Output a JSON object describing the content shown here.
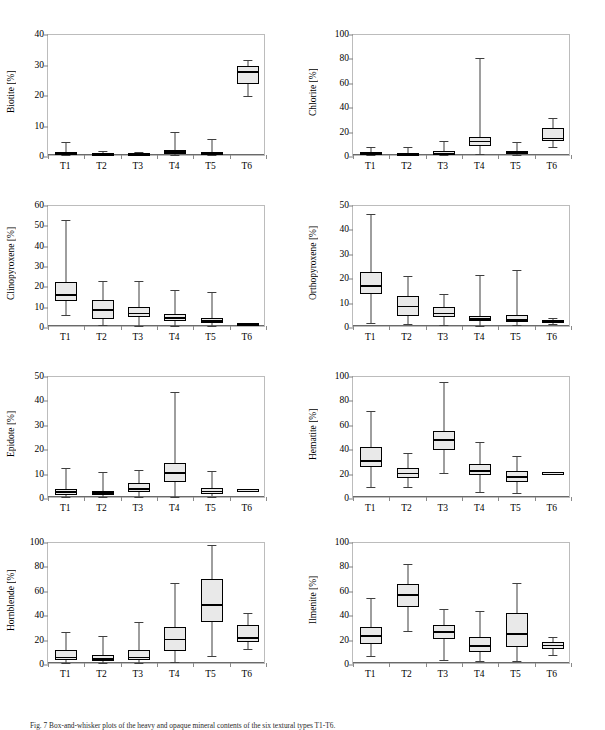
{
  "figure": {
    "caption": "Fig. 7   Box-and-whisker plots of the heavy and opaque mineral contents of the six textural types T1-T6.",
    "categories": [
      "T1",
      "T2",
      "T3",
      "T4",
      "T5",
      "T6"
    ],
    "axis_unit": "[%]",
    "box_fill_color": "#e9e9e9",
    "box_edge_color": "#000000",
    "frame_color": "#bcbcbc"
  },
  "chart_data": [
    {
      "type": "box",
      "title": "Biotite",
      "ylabel": "Biotite [%]",
      "xlabel": "",
      "categories": [
        "T1",
        "T2",
        "T3",
        "T4",
        "T5",
        "T6"
      ],
      "ylim": [
        0,
        40
      ],
      "yticks": [
        0,
        10,
        20,
        30,
        40
      ],
      "grid": false,
      "boxes": [
        {
          "category": "T1",
          "whisker_low": 0.0,
          "q1": 0.1,
          "median": 0.4,
          "q3": 0.9,
          "whisker_high": 4.2
        },
        {
          "category": "T2",
          "whisker_low": 0.0,
          "q1": 0.1,
          "median": 0.3,
          "q3": 0.6,
          "whisker_high": 1.4
        },
        {
          "category": "T3",
          "whisker_low": 0.0,
          "q1": 0.1,
          "median": 0.2,
          "q3": 0.5,
          "whisker_high": 1.1
        },
        {
          "category": "T4",
          "whisker_low": 0.0,
          "q1": 0.3,
          "median": 0.9,
          "q3": 1.7,
          "whisker_high": 7.6
        },
        {
          "category": "T5",
          "whisker_low": 0.0,
          "q1": 0.1,
          "median": 0.4,
          "q3": 1.0,
          "whisker_high": 5.4
        },
        {
          "category": "T6",
          "whisker_low": 19.2,
          "q1": 23.2,
          "median": 27.1,
          "q3": 29.2,
          "whisker_high": 31.1
        }
      ]
    },
    {
      "type": "box",
      "title": "Chlorite",
      "ylabel": "Chlorite [%]",
      "xlabel": "",
      "categories": [
        "T1",
        "T2",
        "T3",
        "T4",
        "T5",
        "T6"
      ],
      "ylim": [
        0,
        100
      ],
      "yticks": [
        0,
        20,
        40,
        60,
        80,
        100
      ],
      "grid": false,
      "boxes": [
        {
          "category": "T1",
          "whisker_low": 0.0,
          "q1": 0.3,
          "median": 1.2,
          "q3": 2.6,
          "whisker_high": 6.6
        },
        {
          "category": "T2",
          "whisker_low": 0.0,
          "q1": 0.2,
          "median": 0.6,
          "q3": 1.5,
          "whisker_high": 6.5
        },
        {
          "category": "T3",
          "whisker_low": 0.0,
          "q1": 0.4,
          "median": 1.3,
          "q3": 3.2,
          "whisker_high": 11.5
        },
        {
          "category": "T4",
          "whisker_low": 0.5,
          "q1": 7.6,
          "median": 11.1,
          "q3": 15.1,
          "whisker_high": 79.6
        },
        {
          "category": "T5",
          "whisker_low": 0.0,
          "q1": 0.6,
          "median": 1.6,
          "q3": 3.3,
          "whisker_high": 10.8
        },
        {
          "category": "T6",
          "whisker_low": 6.2,
          "q1": 11.2,
          "median": 13.5,
          "q3": 22.5,
          "whisker_high": 30.6
        }
      ]
    },
    {
      "type": "box",
      "title": "Clinopyroxene",
      "ylabel": "Clinopyroxene [%]",
      "xlabel": "",
      "categories": [
        "T1",
        "T2",
        "T3",
        "T4",
        "T5",
        "T6"
      ],
      "ylim": [
        0,
        60
      ],
      "yticks": [
        0,
        10,
        20,
        30,
        40,
        50,
        60
      ],
      "grid": false,
      "boxes": [
        {
          "category": "T1",
          "whisker_low": 5.6,
          "q1": 12.4,
          "median": 15.3,
          "q3": 21.5,
          "whisker_high": 52.2
        },
        {
          "category": "T2",
          "whisker_low": 0.3,
          "q1": 3.3,
          "median": 7.7,
          "q3": 12.7,
          "whisker_high": 22.1
        },
        {
          "category": "T3",
          "whisker_low": 0.2,
          "q1": 4.5,
          "median": 6.2,
          "q3": 9.2,
          "whisker_high": 22.3
        },
        {
          "category": "T4",
          "whisker_low": 0.2,
          "q1": 2.7,
          "median": 3.9,
          "q3": 6.1,
          "whisker_high": 17.5
        },
        {
          "category": "T5",
          "whisker_low": 0.2,
          "q1": 1.4,
          "median": 2.4,
          "q3": 4.0,
          "whisker_high": 16.6
        },
        {
          "category": "T6",
          "whisker_low": 0.7,
          "q1": 0.9,
          "median": 1.1,
          "q3": 1.3,
          "whisker_high": 1.6
        }
      ]
    },
    {
      "type": "box",
      "title": "Orthopyroxene",
      "ylabel": "Orthopyroxene [%]",
      "xlabel": "",
      "categories": [
        "T1",
        "T2",
        "T3",
        "T4",
        "T5",
        "T6"
      ],
      "ylim": [
        0,
        50
      ],
      "yticks": [
        0,
        10,
        20,
        30,
        40,
        50
      ],
      "grid": false,
      "boxes": [
        {
          "category": "T1",
          "whisker_low": 1.4,
          "q1": 13.1,
          "median": 16.3,
          "q3": 22.2,
          "whisker_high": 45.8
        },
        {
          "category": "T2",
          "whisker_low": 1.0,
          "q1": 4.2,
          "median": 8.0,
          "q3": 12.3,
          "whisker_high": 20.3
        },
        {
          "category": "T3",
          "whisker_low": 0.3,
          "q1": 3.5,
          "median": 5.1,
          "q3": 7.6,
          "whisker_high": 13.3
        },
        {
          "category": "T4",
          "whisker_low": 0.2,
          "q1": 1.9,
          "median": 2.8,
          "q3": 4.2,
          "whisker_high": 21.0
        },
        {
          "category": "T5",
          "whisker_low": 0.3,
          "q1": 1.6,
          "median": 2.5,
          "q3": 4.7,
          "whisker_high": 23.0
        },
        {
          "category": "T6",
          "whisker_low": 1.0,
          "q1": 1.4,
          "median": 1.8,
          "q3": 2.3,
          "whisker_high": 3.1
        }
      ]
    },
    {
      "type": "box",
      "title": "Epidote",
      "ylabel": "Epidote [%]",
      "xlabel": "",
      "categories": [
        "T1",
        "T2",
        "T3",
        "T4",
        "T5",
        "T6"
      ],
      "ylim": [
        0,
        50
      ],
      "yticks": [
        0,
        10,
        20,
        30,
        40,
        50
      ],
      "grid": false,
      "boxes": [
        {
          "category": "T1",
          "whisker_low": 0.1,
          "q1": 0.9,
          "median": 2.1,
          "q3": 3.1,
          "whisker_high": 11.9
        },
        {
          "category": "T2",
          "whisker_low": 0.0,
          "q1": 0.8,
          "median": 1.5,
          "q3": 2.4,
          "whisker_high": 10.2
        },
        {
          "category": "T3",
          "whisker_low": 0.2,
          "q1": 1.9,
          "median": 3.2,
          "q3": 5.6,
          "whisker_high": 10.9
        },
        {
          "category": "T4",
          "whisker_low": 0.2,
          "q1": 6.0,
          "median": 9.7,
          "q3": 13.8,
          "whisker_high": 43.2
        },
        {
          "category": "T5",
          "whisker_low": 0.2,
          "q1": 1.3,
          "median": 2.3,
          "q3": 3.5,
          "whisker_high": 10.6
        },
        {
          "category": "T6",
          "whisker_low": 2.9,
          "q1": 3.0,
          "median": 3.1,
          "q3": 3.2,
          "whisker_high": 3.3
        }
      ]
    },
    {
      "type": "box",
      "title": "Hematite",
      "ylabel": "Hematite [%]",
      "xlabel": "",
      "categories": [
        "T1",
        "T2",
        "T3",
        "T4",
        "T5",
        "T6"
      ],
      "ylim": [
        0,
        100
      ],
      "yticks": [
        0,
        20,
        40,
        60,
        80,
        100
      ],
      "grid": false,
      "boxes": [
        {
          "category": "T1",
          "whisker_low": 8.3,
          "q1": 24.8,
          "median": 29.5,
          "q3": 41.0,
          "whisker_high": 70.8
        },
        {
          "category": "T2",
          "whisker_low": 7.9,
          "q1": 15.2,
          "median": 19.3,
          "q3": 23.4,
          "whisker_high": 36.0
        },
        {
          "category": "T3",
          "whisker_low": 19.3,
          "q1": 38.8,
          "median": 46.7,
          "q3": 54.5,
          "whisker_high": 94.0
        },
        {
          "category": "T4",
          "whisker_low": 4.4,
          "q1": 18.2,
          "median": 21.5,
          "q3": 26.8,
          "whisker_high": 45.2
        },
        {
          "category": "T5",
          "whisker_low": 3.5,
          "q1": 12.6,
          "median": 16.3,
          "q3": 21.6,
          "whisker_high": 33.3
        },
        {
          "category": "T6",
          "whisker_low": 19.7,
          "q1": 19.9,
          "median": 20.1,
          "q3": 20.3,
          "whisker_high": 20.5
        }
      ]
    },
    {
      "type": "box",
      "title": "Hornblende",
      "ylabel": "Hornblende [%]",
      "xlabel": "",
      "categories": [
        "T1",
        "T2",
        "T3",
        "T4",
        "T5",
        "T6"
      ],
      "ylim": [
        0,
        100
      ],
      "yticks": [
        0,
        20,
        40,
        60,
        80,
        100
      ],
      "grid": false,
      "boxes": [
        {
          "category": "T1",
          "whisker_low": 0.2,
          "q1": 2.3,
          "median": 4.6,
          "q3": 10.3,
          "whisker_high": 25.3
        },
        {
          "category": "T2",
          "whisker_low": 0.2,
          "q1": 1.9,
          "median": 3.3,
          "q3": 6.5,
          "whisker_high": 22.1
        },
        {
          "category": "T3",
          "whisker_low": 0.2,
          "q1": 2.2,
          "median": 4.5,
          "q3": 10.4,
          "whisker_high": 33.5
        },
        {
          "category": "T4",
          "whisker_low": 0.5,
          "q1": 10.0,
          "median": 19.3,
          "q3": 29.8,
          "whisker_high": 65.9
        },
        {
          "category": "T5",
          "whisker_low": 5.7,
          "q1": 34.0,
          "median": 47.5,
          "q3": 68.5,
          "whisker_high": 97.0
        },
        {
          "category": "T6",
          "whisker_low": 11.1,
          "q1": 17.0,
          "median": 20.3,
          "q3": 31.2,
          "whisker_high": 41.2
        }
      ]
    },
    {
      "type": "box",
      "title": "Ilmenite",
      "ylabel": "Ilmenite [%]",
      "xlabel": "",
      "categories": [
        "T1",
        "T2",
        "T3",
        "T4",
        "T5",
        "T6"
      ],
      "ylim": [
        0,
        100
      ],
      "yticks": [
        0,
        20,
        40,
        60,
        80,
        100
      ],
      "grid": false,
      "boxes": [
        {
          "category": "T1",
          "whisker_low": 5.6,
          "q1": 15.2,
          "median": 22.2,
          "q3": 29.2,
          "whisker_high": 53.6
        },
        {
          "category": "T2",
          "whisker_low": 26.5,
          "q1": 46.3,
          "median": 56.0,
          "q3": 64.7,
          "whisker_high": 81.5
        },
        {
          "category": "T3",
          "whisker_low": 2.5,
          "q1": 19.4,
          "median": 25.2,
          "q3": 31.2,
          "whisker_high": 44.3
        },
        {
          "category": "T4",
          "whisker_low": 2.0,
          "q1": 9.3,
          "median": 14.0,
          "q3": 21.7,
          "whisker_high": 42.8
        },
        {
          "category": "T5",
          "whisker_low": 1.8,
          "q1": 13.0,
          "median": 24.0,
          "q3": 40.6,
          "whisker_high": 65.6
        },
        {
          "category": "T6",
          "whisker_low": 6.9,
          "q1": 11.8,
          "median": 14.3,
          "q3": 17.0,
          "whisker_high": 21.3
        }
      ]
    }
  ]
}
